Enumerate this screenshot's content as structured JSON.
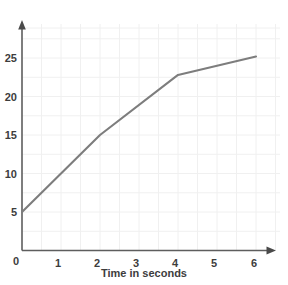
{
  "chart_data": {
    "type": "line",
    "title": "",
    "subtitle": "",
    "xlabel": "Time in seconds",
    "ylabel": "",
    "x": [
      0,
      1,
      2,
      3,
      4,
      5,
      6
    ],
    "series": [
      {
        "name": "distance",
        "points": [
          {
            "x": 0,
            "y": 5
          },
          {
            "x": 2,
            "y": 15
          },
          {
            "x": 4,
            "y": 22.8
          },
          {
            "x": 6,
            "y": 25.2
          }
        ],
        "color": "#7d7d7d"
      }
    ],
    "xlim": [
      0,
      6
    ],
    "ylim": [
      0,
      27
    ],
    "xticks": [
      0,
      1,
      2,
      3,
      4,
      5,
      6
    ],
    "xticklabels": [
      "0",
      "1",
      "2",
      "3",
      "4",
      "5",
      "6"
    ],
    "yticks": [
      5,
      10,
      15,
      20,
      25
    ],
    "yticklabels": [
      "5",
      "10",
      "15",
      "20",
      "25"
    ],
    "grid": true,
    "grid_color": "#efefef",
    "legend": "none",
    "axis_color": "#606060",
    "arrow_heads": [
      "x-axis-right",
      "y-axis-top"
    ],
    "annotations": []
  },
  "axes": {
    "x_title": "Time in seconds",
    "y_title": "",
    "y_tick_0": "5",
    "y_tick_1": "10",
    "y_tick_2": "15",
    "y_tick_3": "20",
    "y_tick_4": "25",
    "x_tick_0": "0",
    "x_tick_1": "1",
    "x_tick_2": "2",
    "x_tick_3": "3",
    "x_tick_4": "4",
    "x_tick_5": "5",
    "x_tick_6": "6"
  }
}
